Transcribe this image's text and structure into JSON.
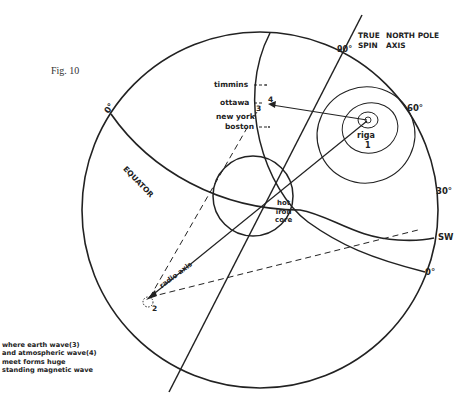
{
  "figure": {
    "caption": "Fig. 10"
  },
  "axis_label": {
    "line1_a": "TRUE",
    "line1_b": "NORTH POLE",
    "line2_a": "SPIN",
    "line2_b": "AXIS"
  },
  "degree_marks": {
    "deg90": "90°",
    "deg60": "60°",
    "deg30": "30°",
    "deg0_right": "0°",
    "deg0_left": "0°"
  },
  "direction": {
    "sw": "SW"
  },
  "equator": {
    "label": "EQUATOR"
  },
  "core": {
    "line1": "hot",
    "line2": "iron",
    "line3": "core"
  },
  "cities": {
    "timmins": "timmins",
    "ottawa": "ottawa",
    "new_york": "new york",
    "boston": "boston"
  },
  "markers": {
    "riga_label": "riga",
    "riga_num": "1",
    "point2": "2",
    "point3": "3",
    "point4": "4"
  },
  "radio_axis": {
    "label": "radio axis"
  },
  "note": {
    "line1": "where earth wave(3)",
    "line2": "and atmospheric wave(4)",
    "line3": "meet forms huge",
    "line4": "standing magnetic wave"
  },
  "colors": {
    "ink": "#222222",
    "paper": "#ffffff"
  }
}
